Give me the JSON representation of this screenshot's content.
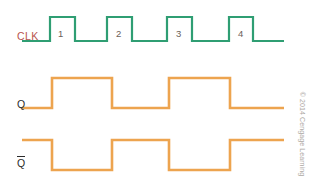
{
  "figure": {
    "background": "#ffffff",
    "width": 309,
    "height": 188
  },
  "colors": {
    "clk_wave": "#2f9e73",
    "data_wave": "#eda44f",
    "clk_label": "#b9554e",
    "data_label": "#2b2b2b",
    "cycle_number": "#6b6158",
    "credit": "#ada8a3"
  },
  "signals": [
    {
      "name": "clk",
      "label": "CLK",
      "label_color": "#b9554e",
      "wave_color": "#2f9e73",
      "stroke_width": 2.2,
      "high_y": 17,
      "low_y": 41,
      "x_start": 22,
      "x_end": 284,
      "polarity": "starts-low",
      "transitions": [
        50,
        75,
        107,
        132,
        167,
        192,
        229,
        253
      ],
      "points": "22,41 50,41 50,17 75,17 75,41 107,41 107,17 132,17 132,41 167,41 167,17 192,17 192,41 229,41 229,17 253,17 253,41 284,41"
    },
    {
      "name": "q",
      "label": "Q",
      "label_color": "#2b2b2b",
      "wave_color": "#eda44f",
      "stroke_width": 2.6,
      "high_y": 78,
      "low_y": 108,
      "x_start": 22,
      "x_end": 284,
      "polarity": "starts-low",
      "transitions": [
        52,
        112,
        169,
        230
      ],
      "points": "22,108 52,108 52,78 112,78 112,108 169,108 169,78 230,78 230,108 284,108"
    },
    {
      "name": "qbar",
      "label": "Q",
      "label_overbar": true,
      "label_color": "#2b2b2b",
      "wave_color": "#eda44f",
      "stroke_width": 2.6,
      "high_y": 140,
      "low_y": 170,
      "x_start": 22,
      "x_end": 284,
      "polarity": "starts-high",
      "transitions": [
        52,
        112,
        169,
        230
      ],
      "points": "22,140 52,140 52,170 112,170 112,140 169,140 169,170 230,170 230,140 284,140"
    }
  ],
  "cycle_numbers": [
    {
      "label": "1",
      "x": 58,
      "y": 29
    },
    {
      "label": "2",
      "x": 116,
      "y": 29
    },
    {
      "label": "3",
      "x": 176,
      "y": 29
    },
    {
      "label": "4",
      "x": 238,
      "y": 29
    }
  ],
  "credit": {
    "text": "© 2014 Cengage Learning"
  }
}
